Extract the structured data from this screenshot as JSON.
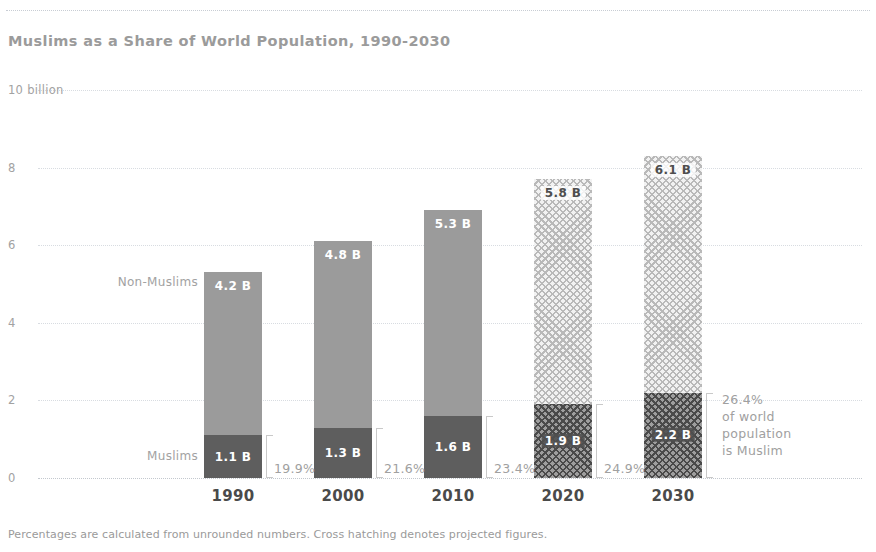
{
  "header": {
    "title": "Muslims as a Share of World Population, 1990-2030"
  },
  "footnote": "Percentages are calculated from unrounded numbers. Cross hatching denotes projected figures.",
  "legend": {
    "non_muslims": "Non-Muslims",
    "muslims": "Muslims"
  },
  "callout": {
    "line1": "26.4%",
    "line2": "of world",
    "line3": "population",
    "line4": "is Muslim"
  },
  "colors": {
    "non_muslims": "#9b9b9b",
    "muslims": "#5e5e5e",
    "non_muslims_projected": "#b9b9b9",
    "muslims_projected": "#9e9e9e",
    "gridline": "#d8dce1",
    "title": "#9b9b9b",
    "axis_text": "#4a4a4a"
  },
  "chart_data": {
    "type": "bar",
    "subtype": "stacked-bar",
    "title": "Muslims as a Share of World Population, 1990-2030",
    "xlabel": "",
    "ylabel": "",
    "ylim": [
      0,
      10
    ],
    "yticks": [
      0,
      2,
      4,
      6,
      8,
      10
    ],
    "ytick_labels": [
      "0",
      "2",
      "4",
      "6",
      "8",
      "10 billion"
    ],
    "grid": true,
    "legend_position": "inline-left",
    "categories": [
      "1990",
      "2000",
      "2010",
      "2020",
      "2030"
    ],
    "projected": [
      false,
      false,
      false,
      true,
      true
    ],
    "series": [
      {
        "name": "Muslims",
        "values": [
          1.1,
          1.3,
          1.6,
          1.9,
          2.2
        ],
        "labels": [
          "1.1 B",
          "1.3 B",
          "1.6 B",
          "1.9 B",
          "2.2 B"
        ]
      },
      {
        "name": "Non-Muslims",
        "values": [
          4.2,
          4.8,
          5.3,
          5.8,
          6.1
        ],
        "labels": [
          "4.2 B",
          "4.8 B",
          "5.3 B",
          "5.8 B",
          "6.1 B"
        ]
      }
    ],
    "totals": [
      5.3,
      6.1,
      6.9,
      7.7,
      8.3
    ],
    "annotations": [
      {
        "category": "1990",
        "text": "19.9%"
      },
      {
        "category": "2000",
        "text": "21.6%"
      },
      {
        "category": "2010",
        "text": "23.4%"
      },
      {
        "category": "2020",
        "text": "24.9%"
      },
      {
        "category": "2030",
        "text": "26.4%"
      }
    ],
    "note": "Percentages are calculated from unrounded numbers. Cross hatching denotes projected figures."
  }
}
